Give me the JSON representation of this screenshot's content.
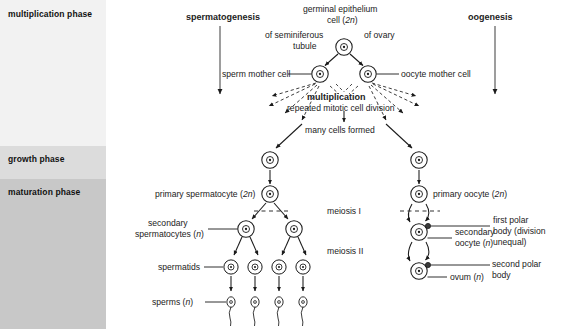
{
  "diagram": {
    "title_left": "spermatogenesis",
    "title_right": "oogenesis",
    "source_cell_line1": "germinal epithelium",
    "source_cell_line2": "cell (2n)",
    "of_seminiferous": "of seminiferous",
    "tubule": "tubule",
    "of_ovary": "of ovary",
    "sperm_mother_cell": "sperm mother cell",
    "oocyte_mother_cell": "oocyte mother cell",
    "multiplication": "multiplication",
    "repeated_mitotic": "repeated mitotic cell division",
    "many_cells_formed": "many cells formed",
    "primary_spermatocyte": "primary spermatocyte (2n)",
    "primary_oocyte": "primary oocyte (2n)",
    "meiosis_1": "meiosis I",
    "meiosis_2": "meiosis II",
    "secondary_spermatocytes_l1": "secondary",
    "secondary_spermatocytes_l2": "spermatocytes (n)",
    "secondary_oocyte_l1": "secondary",
    "secondary_oocyte_l2": "oocyte (n)",
    "first_polar_body_l1": "first polar",
    "first_polar_body_l2": "body (division",
    "first_polar_body_l3": "unequal)",
    "second_polar_body_l1": "second polar",
    "second_polar_body_l2": "body",
    "ovum": "ovum (n)",
    "spermatids": "spermatids",
    "sperms": "sperms (n)"
  },
  "phases": [
    {
      "label": "multiplication phase",
      "color": "#f2f2f2",
      "top": 0,
      "height": 146
    },
    {
      "label": "growth phase",
      "color": "#dcdcdc",
      "top": 146,
      "height": 33
    },
    {
      "label": "maturation phase",
      "color": "#c8c8c8",
      "top": 179,
      "height": 150
    }
  ],
  "colors": {
    "stroke": "#1a1a1a",
    "text": "#222222",
    "background": "#ffffff"
  }
}
